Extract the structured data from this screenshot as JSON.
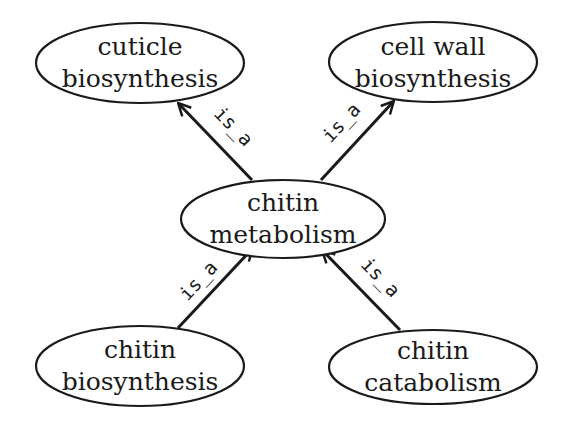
{
  "diagram": {
    "type": "directed-graph",
    "nodes": [
      {
        "id": "cuticle_biosynthesis",
        "line1": "cuticle",
        "line2": "biosynthesis",
        "cx": 140,
        "cy": 63,
        "rx": 104,
        "ry": 40
      },
      {
        "id": "cell_wall_biosynthesis",
        "line1": "cell wall",
        "line2": "biosynthesis",
        "cx": 433,
        "cy": 62,
        "rx": 104,
        "ry": 40
      },
      {
        "id": "chitin_metabolism",
        "line1": "chitin",
        "line2": "metabolism",
        "cx": 283,
        "cy": 219,
        "rx": 102,
        "ry": 39
      },
      {
        "id": "chitin_biosynthesis",
        "line1": "chitin",
        "line2": "biosynthesis",
        "cx": 140,
        "cy": 366,
        "rx": 104,
        "ry": 40
      },
      {
        "id": "chitin_catabolism",
        "line1": "chitin",
        "line2": "catabolism",
        "cx": 433,
        "cy": 367,
        "rx": 104,
        "ry": 37
      }
    ],
    "edges": [
      {
        "from": "chitin_metabolism",
        "to": "cuticle_biosynthesis",
        "label": "is_a"
      },
      {
        "from": "chitin_metabolism",
        "to": "cell_wall_biosynthesis",
        "label": "is_a"
      },
      {
        "from": "chitin_biosynthesis",
        "to": "chitin_metabolism",
        "label": "is_a"
      },
      {
        "from": "chitin_catabolism",
        "to": "chitin_metabolism",
        "label": "is_a"
      }
    ]
  },
  "labels": {
    "n0": {
      "l1": "cuticle",
      "l2": "biosynthesis"
    },
    "n1": {
      "l1": "cell wall",
      "l2": "biosynthesis"
    },
    "n2": {
      "l1": "chitin",
      "l2": "metabolism"
    },
    "n3": {
      "l1": "chitin",
      "l2": "biosynthesis"
    },
    "n4": {
      "l1": "chitin",
      "l2": "catabolism"
    },
    "e0": "is_a",
    "e1": "is_a",
    "e2": "is_a",
    "e3": "is_a"
  }
}
